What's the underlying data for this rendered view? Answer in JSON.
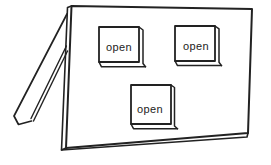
{
  "figure": {
    "flaps": [
      {
        "label": "open"
      },
      {
        "label": "open"
      },
      {
        "label": "open"
      }
    ]
  },
  "colors": {
    "ink": "#222222",
    "paper": "#ffffff"
  }
}
